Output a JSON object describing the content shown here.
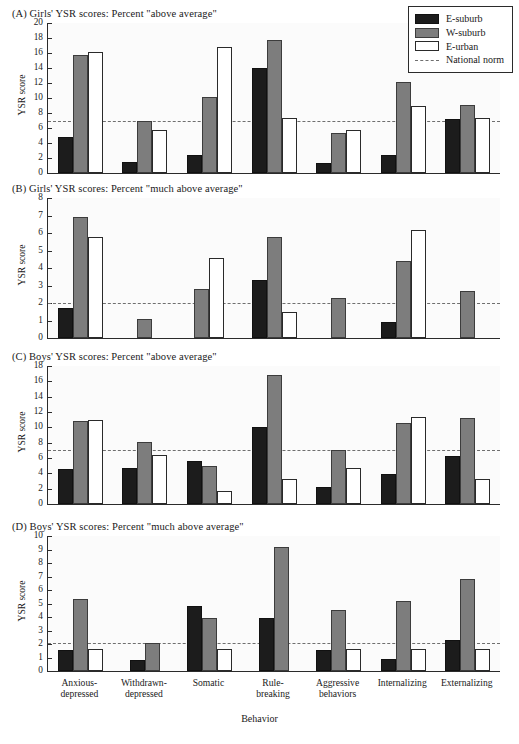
{
  "figure": {
    "xlabel": "Behavior",
    "ylabel": "YSR score",
    "categories": [
      [
        "Anxious-",
        "depressed"
      ],
      [
        "Withdrawn-",
        "depressed"
      ],
      [
        "Somatic"
      ],
      [
        "Rule-",
        "breaking"
      ],
      [
        "Aggressive",
        "behaviors"
      ],
      [
        "Internalizing"
      ],
      [
        "Externalizing"
      ]
    ]
  },
  "legend": {
    "position": "top-right",
    "entries": [
      {
        "label": "E-suburb",
        "key": "esub",
        "color": "#1c1c1c"
      },
      {
        "label": "W-suburb",
        "key": "wsub",
        "color": "#7d7d7d"
      },
      {
        "label": "E-urban",
        "key": "eurb",
        "color": "#ffffff"
      },
      {
        "label": "National norm",
        "key": "norm",
        "color": "#6f6f6f"
      }
    ]
  },
  "chart_data": [
    {
      "id": "A",
      "type": "bar",
      "title": "(A)  Girls' YSR scores: Percent \"above average\"",
      "panel_letter": "(A)",
      "xlabel": "",
      "ylabel": "YSR score",
      "ylim": [
        0,
        20
      ],
      "yticks": [
        0,
        2,
        4,
        6,
        8,
        10,
        12,
        14,
        16,
        18,
        20
      ],
      "grid": false,
      "national_norm": 6.9,
      "categories": [
        "Anxious-depressed",
        "Withdrawn-depressed",
        "Somatic",
        "Rule-breaking",
        "Aggressive behaviors",
        "Internalizing",
        "Externalizing"
      ],
      "series": [
        {
          "name": "E-suburb",
          "values": [
            4.8,
            1.5,
            2.4,
            14.0,
            1.4,
            2.4,
            7.2
          ]
        },
        {
          "name": "W-suburb",
          "values": [
            15.7,
            6.9,
            10.2,
            17.7,
            5.4,
            12.2,
            9.1
          ]
        },
        {
          "name": "E-urban",
          "values": [
            16.1,
            5.8,
            16.8,
            7.4,
            5.7,
            9.0,
            7.3
          ]
        }
      ]
    },
    {
      "id": "B",
      "type": "bar",
      "title": "(B)  Girls' YSR scores: Percent \"much above average\"",
      "panel_letter": "(B)",
      "xlabel": "",
      "ylabel": "YSR score",
      "ylim": [
        0,
        8
      ],
      "yticks": [
        0,
        1,
        2,
        3,
        4,
        5,
        6,
        7,
        8
      ],
      "grid": false,
      "national_norm": 2.0,
      "categories": [
        "Anxious-depressed",
        "Withdrawn-depressed",
        "Somatic",
        "Rule-breaking",
        "Aggressive behaviors",
        "Internalizing",
        "Externalizing"
      ],
      "series": [
        {
          "name": "E-suburb",
          "values": [
            1.7,
            0.0,
            0.0,
            3.3,
            0.0,
            0.9,
            0.0
          ]
        },
        {
          "name": "W-suburb",
          "values": [
            6.9,
            1.1,
            2.8,
            5.8,
            2.3,
            4.4,
            2.7
          ]
        },
        {
          "name": "E-urban",
          "values": [
            5.8,
            0.0,
            4.6,
            1.5,
            0.0,
            6.2,
            0.0
          ]
        }
      ]
    },
    {
      "id": "C",
      "type": "bar",
      "title": "(C)  Boys' YSR scores: Percent \"above average\"",
      "panel_letter": "(C)",
      "xlabel": "",
      "ylabel": "YSR score",
      "ylim": [
        0,
        18
      ],
      "yticks": [
        0,
        2,
        4,
        6,
        8,
        10,
        12,
        14,
        16,
        18
      ],
      "grid": false,
      "national_norm": 7.1,
      "categories": [
        "Anxious-depressed",
        "Withdrawn-depressed",
        "Somatic",
        "Rule-breaking",
        "Aggressive behaviors",
        "Internalizing",
        "Externalizing"
      ],
      "series": [
        {
          "name": "E-suburb",
          "values": [
            4.6,
            4.7,
            5.6,
            10.1,
            2.2,
            3.9,
            6.2
          ]
        },
        {
          "name": "W-suburb",
          "values": [
            10.8,
            8.1,
            4.9,
            16.8,
            7.1,
            10.6,
            11.2
          ]
        },
        {
          "name": "E-urban",
          "values": [
            11.0,
            6.4,
            1.7,
            3.2,
            4.7,
            11.4,
            3.2
          ]
        }
      ]
    },
    {
      "id": "D",
      "type": "bar",
      "title": "(D)  Boys' YSR scores: Percent \"much above average\"",
      "panel_letter": "(D)",
      "xlabel": "Behavior",
      "ylabel": "YSR score",
      "ylim": [
        0,
        10
      ],
      "yticks": [
        0,
        1,
        2,
        3,
        4,
        5,
        6,
        7,
        8,
        9,
        10
      ],
      "grid": false,
      "national_norm": 2.1,
      "categories": [
        "Anxious-depressed",
        "Withdrawn-depressed",
        "Somatic",
        "Rule-breaking",
        "Aggressive behaviors",
        "Internalizing",
        "Externalizing"
      ],
      "series": [
        {
          "name": "E-suburb",
          "values": [
            1.55,
            0.85,
            4.8,
            3.95,
            1.55,
            0.9,
            2.3
          ]
        },
        {
          "name": "W-suburb",
          "values": [
            5.35,
            2.1,
            3.9,
            9.15,
            4.55,
            5.2,
            6.85
          ]
        },
        {
          "name": "E-urban",
          "values": [
            1.6,
            0.0,
            1.6,
            0.0,
            1.6,
            1.6,
            1.6
          ]
        }
      ]
    }
  ]
}
